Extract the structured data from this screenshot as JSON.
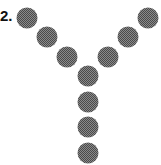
{
  "item": {
    "label": "2.",
    "shape": "Y",
    "dot_color": "#6e6e6e",
    "dot_radius": 10.5,
    "dots": [
      {
        "x": 27,
        "y": 18
      },
      {
        "x": 47,
        "y": 37
      },
      {
        "x": 67,
        "y": 57
      },
      {
        "x": 88,
        "y": 76
      },
      {
        "x": 88,
        "y": 102
      },
      {
        "x": 88,
        "y": 127
      },
      {
        "x": 88,
        "y": 153
      },
      {
        "x": 108,
        "y": 57
      },
      {
        "x": 128,
        "y": 37
      },
      {
        "x": 148,
        "y": 18
      }
    ]
  }
}
